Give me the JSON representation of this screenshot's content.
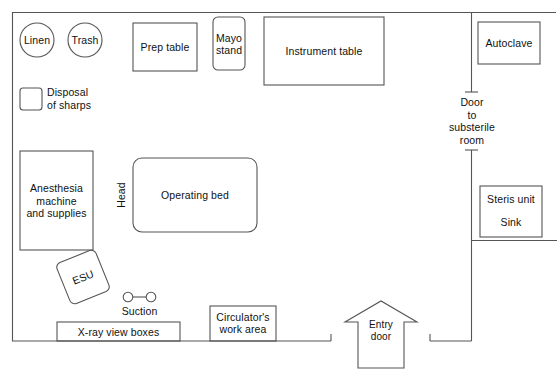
{
  "diagram": {
    "stroke_color": "#555555",
    "text_color": "#111111",
    "background": "#ffffff"
  },
  "room": {
    "wall_label": "operating-room-walls"
  },
  "equipment": {
    "linen": "Linen",
    "trash": "Trash",
    "disposal_of_sharps": "Disposal\nof sharps",
    "prep_table": "Prep table",
    "mayo_stand": "Mayo\nstand",
    "instrument_table": "Instrument table",
    "autoclave": "Autoclave",
    "anesthesia": "Anesthesia\nmachine\nand supplies",
    "operating_bed": "Operating bed",
    "head": "Head",
    "esu": "ESU",
    "suction": "Suction",
    "xray_view_boxes": "X-ray view boxes",
    "circulator_work_area": "Circulator's\nwork area",
    "steris_unit": "Steris unit",
    "sink": "Sink"
  },
  "doors": {
    "substerile": "Door\nto\nsubsterile\nroom",
    "entry": "Entry\ndoor"
  }
}
